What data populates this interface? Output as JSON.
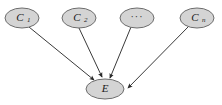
{
  "figure": {
    "background_color": "#ffffff",
    "node_fill_color": "#d4d4d4",
    "node_border_color": "#6e6e6e",
    "edge_color": "#3a3a3a"
  },
  "nodes": [
    {
      "id": "c1",
      "label": "C",
      "subscript": "1",
      "role": "cause",
      "cx": 22,
      "cy": 18,
      "rx": 17,
      "ry": 10
    },
    {
      "id": "c2",
      "label": "C",
      "subscript": "2",
      "role": "cause",
      "cx": 79,
      "cy": 18,
      "rx": 17,
      "ry": 10
    },
    {
      "id": "cdots",
      "label": "···",
      "subscript": "",
      "role": "cause-ellipsis",
      "cx": 137,
      "cy": 18,
      "rx": 17,
      "ry": 10
    },
    {
      "id": "cn",
      "label": "C",
      "subscript": "n",
      "role": "cause",
      "cx": 197,
      "cy": 18,
      "rx": 17,
      "ry": 10
    },
    {
      "id": "e",
      "label": "E",
      "subscript": "",
      "role": "effect",
      "cx": 105,
      "cy": 89,
      "rx": 19,
      "ry": 10
    }
  ],
  "edges": [
    {
      "id": "c1-e",
      "from": "C1",
      "to": "E",
      "arrowhead": true
    },
    {
      "id": "c2-e",
      "from": "C2",
      "to": "E",
      "arrowhead": true
    },
    {
      "id": "cdots-e",
      "from": "···",
      "to": "E",
      "arrowhead": true
    },
    {
      "id": "cn-e",
      "from": "Cn",
      "to": "E",
      "arrowhead": true
    }
  ],
  "labels": {
    "c1_label": "C",
    "c1_sub": "1",
    "c2_label": "C",
    "c2_sub": "2",
    "cdots_label": "···",
    "cn_label": "C",
    "cn_sub": "n",
    "e_label": "E"
  }
}
